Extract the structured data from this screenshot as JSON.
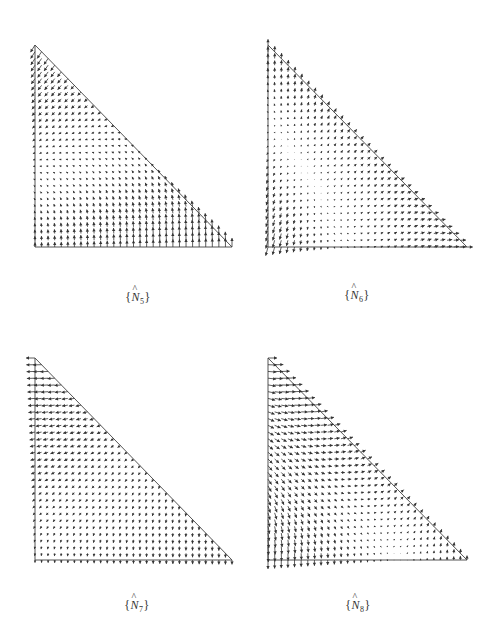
{
  "figure": {
    "stroke_color": "#333333",
    "edge_color": "#555555",
    "grid_divisions": 30,
    "max_arrow_px": 9,
    "panels": [
      {
        "id": "N5",
        "caption": {
          "open": "{",
          "symbol": "N",
          "hat": "^",
          "subscript": "5",
          "close": "}"
        },
        "triangle": {
          "left_x": 35,
          "top_y": 45,
          "right_x": 232,
          "bottom_y": 247
        },
        "caption_pos": {
          "x": 138,
          "y": 290
        },
        "field": {
          "vx": [
            0,
            0,
            -1,
            0,
            0,
            0
          ],
          "vy": [
            1,
            1,
            -2.6,
            0,
            0,
            0
          ]
        }
      },
      {
        "id": "N6",
        "caption": {
          "open": "{",
          "symbol": "N",
          "hat": "^",
          "subscript": "6",
          "close": "}"
        },
        "triangle": {
          "left_x": 268,
          "top_y": 45,
          "right_x": 467,
          "bottom_y": 247
        },
        "caption_pos": {
          "x": 357,
          "y": 288
        },
        "field": {
          "vx": [
            -0.4,
            1.4,
            0.4,
            0,
            0,
            0
          ],
          "vy": [
            -1.5,
            4.8,
            2.5,
            -3.3,
            -3.3,
            0
          ]
        }
      },
      {
        "id": "N7",
        "caption": {
          "open": "{",
          "symbol": "N",
          "hat": "^",
          "subscript": "7",
          "close": "}"
        },
        "triangle": {
          "left_x": 35,
          "top_y": 358,
          "right_x": 232,
          "bottom_y": 560
        },
        "caption_pos": {
          "x": 137,
          "y": 598
        },
        "field": {
          "vx": [
            0,
            0,
            -2,
            0,
            2,
            0
          ],
          "vy": [
            -0.6,
            -0.4,
            0.6,
            0,
            0,
            0
          ]
        }
      },
      {
        "id": "N8",
        "caption": {
          "open": "{",
          "symbol": "N",
          "hat": "^",
          "subscript": "8",
          "close": "}"
        },
        "triangle": {
          "left_x": 268,
          "top_y": 358,
          "right_x": 467,
          "bottom_y": 560
        },
        "caption_pos": {
          "x": 358,
          "y": 598
        },
        "field": {
          "vx": [
            0,
            0,
            1,
            0,
            0,
            0
          ],
          "vy": [
            -1,
            1.5,
            1,
            0,
            0,
            0
          ]
        }
      }
    ]
  }
}
